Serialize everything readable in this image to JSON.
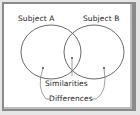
{
  "diagram": {
    "type": "venn",
    "labels": {
      "subject_a": "Subject A",
      "subject_b": "Subject B",
      "similarities": "Similarities",
      "differences": "Differences"
    },
    "colors": {
      "stroke": "#444444",
      "background": "#ffffff",
      "frame": "#8a8a8a",
      "outer": "#e6e6e6"
    }
  }
}
